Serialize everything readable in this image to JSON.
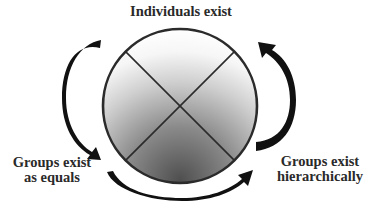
{
  "diagram": {
    "labels": {
      "top": "Individuals exist",
      "left_line1": "Groups exist",
      "left_line2": "as equals",
      "right_line1": "Groups exist",
      "right_line2": "hierarchically"
    },
    "circle": {
      "center": [
        180,
        106
      ],
      "radius": 77,
      "quadrants": 4,
      "gradient_light": "#ffffff",
      "gradient_dark": "#5a5a5a",
      "stroke": "#2b2b2b"
    },
    "arrows": [
      {
        "name": "left-arrow",
        "from": "top-left",
        "to": "Groups exist as equals",
        "direction": "counterclockwise-down"
      },
      {
        "name": "bottom-arrow",
        "from": "Groups exist as equals",
        "to": "Groups exist hierarchically",
        "direction": "left-to-right"
      },
      {
        "name": "right-arrow",
        "from": "Groups exist hierarchically",
        "to": "top-right",
        "direction": "upward"
      }
    ],
    "arrow_color": "#111111"
  }
}
